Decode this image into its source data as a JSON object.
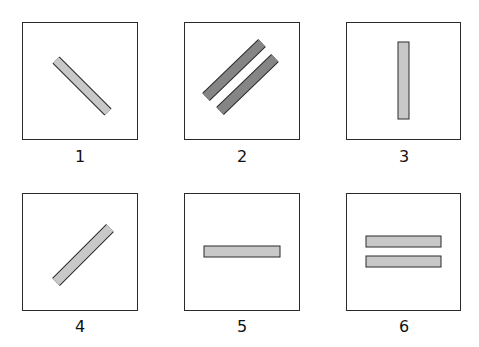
{
  "diagram": {
    "panels": [
      {
        "id": 1,
        "label": "1",
        "bars": [
          {
            "orientation": "diagonal-down-right",
            "count": 1,
            "fill": "#c8c8c8"
          }
        ]
      },
      {
        "id": 2,
        "label": "2",
        "bars": [
          {
            "orientation": "diagonal-up-right",
            "count": 2,
            "fill": "#858585"
          }
        ]
      },
      {
        "id": 3,
        "label": "3",
        "bars": [
          {
            "orientation": "vertical",
            "count": 1,
            "fill": "#c8c8c8"
          }
        ]
      },
      {
        "id": 4,
        "label": "4",
        "bars": [
          {
            "orientation": "diagonal-up-right",
            "count": 1,
            "fill": "#c8c8c8"
          }
        ]
      },
      {
        "id": 5,
        "label": "5",
        "bars": [
          {
            "orientation": "horizontal",
            "count": 1,
            "fill": "#c8c8c8"
          }
        ]
      },
      {
        "id": 6,
        "label": "6",
        "bars": [
          {
            "orientation": "horizontal",
            "count": 2,
            "fill": "#c8c8c8"
          }
        ]
      }
    ],
    "colors": {
      "light_bar": "#c8c8c8",
      "dark_bar": "#858585",
      "outline": "#2a2a2a"
    }
  }
}
